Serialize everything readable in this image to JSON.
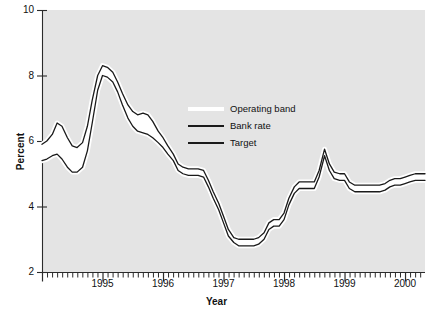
{
  "chart_data": {
    "type": "line",
    "title": "",
    "xlabel": "Year",
    "ylabel": "Percent",
    "xlim": [
      1994.0,
      2000.33
    ],
    "ylim": [
      2,
      10
    ],
    "yticks": [
      2,
      4,
      6,
      8,
      10
    ],
    "ytick_labels": [
      "2",
      "4",
      "6",
      "8",
      "10"
    ],
    "xticks": [
      1995,
      1996,
      1997,
      1998,
      1999,
      2000
    ],
    "xtick_labels": [
      "1995",
      "1996",
      "1997",
      "1998",
      "1999",
      "2000"
    ],
    "minor_tick_interval_months": 1,
    "grid": false,
    "plot_background": "#e4e4e4",
    "band_fill": "#ffffff",
    "line_color": "#1a1a1a",
    "legend_position": "center",
    "legend": [
      {
        "label": "Operating band",
        "swatch": "#ffffff",
        "type": "band"
      },
      {
        "label": "Bank rate",
        "swatch": "#1a1a1a",
        "type": "line"
      },
      {
        "label": "Target",
        "swatch": "#1a1a1a",
        "type": "line"
      }
    ],
    "series": [
      {
        "name": "Bank rate",
        "description": "Upper edge of the operating band",
        "x": [
          1994.0,
          1994.08,
          1994.17,
          1994.25,
          1994.33,
          1994.42,
          1994.5,
          1994.58,
          1994.67,
          1994.75,
          1994.83,
          1994.92,
          1995.0,
          1995.08,
          1995.17,
          1995.25,
          1995.33,
          1995.42,
          1995.5,
          1995.58,
          1995.67,
          1995.75,
          1995.83,
          1995.92,
          1996.0,
          1996.08,
          1996.17,
          1996.25,
          1996.33,
          1996.42,
          1996.5,
          1996.58,
          1996.67,
          1996.75,
          1996.83,
          1996.92,
          1997.0,
          1997.08,
          1997.17,
          1997.25,
          1997.33,
          1997.42,
          1997.5,
          1997.58,
          1997.67,
          1997.75,
          1997.83,
          1997.92,
          1998.0,
          1998.08,
          1998.17,
          1998.25,
          1998.33,
          1998.42,
          1998.5,
          1998.58,
          1998.67,
          1998.75,
          1998.83,
          1998.92,
          1999.0,
          1999.08,
          1999.17,
          1999.25,
          1999.33,
          1999.42,
          1999.5,
          1999.58,
          1999.67,
          1999.75,
          1999.83,
          1999.92,
          2000.0,
          2000.08,
          2000.17,
          2000.25,
          2000.33
        ],
        "values": [
          5.9,
          6.0,
          6.2,
          6.55,
          6.45,
          6.1,
          5.85,
          5.8,
          5.95,
          6.45,
          7.25,
          8.0,
          8.3,
          8.25,
          8.1,
          7.8,
          7.45,
          7.1,
          6.9,
          6.8,
          6.85,
          6.8,
          6.6,
          6.3,
          6.1,
          5.85,
          5.6,
          5.3,
          5.2,
          5.15,
          5.15,
          5.15,
          5.1,
          4.8,
          4.45,
          4.1,
          3.7,
          3.3,
          3.05,
          3.0,
          3.0,
          3.0,
          3.0,
          3.05,
          3.2,
          3.5,
          3.6,
          3.6,
          3.8,
          4.25,
          4.6,
          4.75,
          4.75,
          4.75,
          4.75,
          5.1,
          5.75,
          5.3,
          5.05,
          5.0,
          5.0,
          4.75,
          4.65,
          4.65,
          4.65,
          4.65,
          4.65,
          4.65,
          4.7,
          4.8,
          4.85,
          4.85,
          4.9,
          4.95,
          5.0,
          5.0,
          5.0
        ]
      },
      {
        "name": "Target",
        "description": "Lower edge / target rate within the operating band",
        "x": [
          1994.0,
          1994.08,
          1994.17,
          1994.25,
          1994.33,
          1994.42,
          1994.5,
          1994.58,
          1994.67,
          1994.75,
          1994.83,
          1994.92,
          1995.0,
          1995.08,
          1995.17,
          1995.25,
          1995.33,
          1995.42,
          1995.5,
          1995.58,
          1995.67,
          1995.75,
          1995.83,
          1995.92,
          1996.0,
          1996.08,
          1996.17,
          1996.25,
          1996.33,
          1996.42,
          1996.5,
          1996.58,
          1996.67,
          1996.75,
          1996.83,
          1996.92,
          1997.0,
          1997.08,
          1997.17,
          1997.25,
          1997.33,
          1997.42,
          1997.5,
          1997.58,
          1997.67,
          1997.75,
          1997.83,
          1997.92,
          1998.0,
          1998.08,
          1998.17,
          1998.25,
          1998.33,
          1998.42,
          1998.5,
          1998.58,
          1998.67,
          1998.75,
          1998.83,
          1998.92,
          1999.0,
          1999.08,
          1999.17,
          1999.25,
          1999.33,
          1999.42,
          1999.5,
          1999.58,
          1999.67,
          1999.75,
          1999.83,
          1999.92,
          2000.0,
          2000.08,
          2000.17,
          2000.25,
          2000.33
        ],
        "values": [
          5.4,
          5.45,
          5.55,
          5.6,
          5.45,
          5.2,
          5.05,
          5.05,
          5.2,
          5.7,
          6.55,
          7.55,
          8.0,
          7.95,
          7.8,
          7.5,
          7.1,
          6.7,
          6.45,
          6.3,
          6.25,
          6.2,
          6.1,
          5.95,
          5.8,
          5.6,
          5.4,
          5.1,
          5.0,
          4.95,
          4.95,
          4.95,
          4.9,
          4.6,
          4.25,
          3.9,
          3.5,
          3.1,
          2.9,
          2.8,
          2.8,
          2.8,
          2.8,
          2.85,
          3.0,
          3.3,
          3.4,
          3.4,
          3.6,
          4.05,
          4.4,
          4.55,
          4.55,
          4.55,
          4.55,
          4.9,
          5.55,
          5.1,
          4.85,
          4.8,
          4.8,
          4.55,
          4.45,
          4.45,
          4.45,
          4.45,
          4.45,
          4.45,
          4.5,
          4.6,
          4.65,
          4.65,
          4.7,
          4.75,
          4.8,
          4.8,
          4.8
        ]
      }
    ]
  }
}
